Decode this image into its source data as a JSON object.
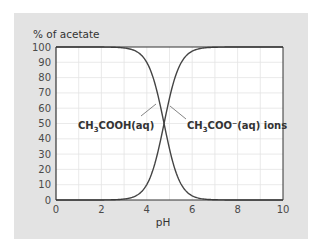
{
  "chart_data": {
    "type": "line",
    "title": "",
    "ylabel": "% of acetate",
    "xlabel": "pH",
    "xlim": [
      0,
      10
    ],
    "ylim": [
      0,
      100
    ],
    "x_ticks": [
      0,
      2,
      4,
      6,
      8,
      10
    ],
    "y_ticks": [
      0,
      10,
      20,
      30,
      40,
      50,
      60,
      70,
      80,
      90,
      100
    ],
    "grid": true,
    "legend": "inline annotations",
    "x": [
      0,
      1,
      2,
      2.5,
      3,
      3.5,
      4,
      4.25,
      4.5,
      4.76,
      5,
      5.25,
      5.5,
      6,
      6.5,
      7,
      8,
      9,
      10
    ],
    "series": [
      {
        "name": "CH3COOH(aq)",
        "label_main": "CH",
        "label_sub": "3",
        "label_rest": "COOH(aq)",
        "values": [
          100,
          100,
          99.4,
          98.2,
          94.6,
          84.8,
          85.2,
          76.4,
          64.5,
          50,
          36.5,
          24.4,
          15.4,
          5.4,
          1.8,
          0.6,
          0.1,
          0,
          0
        ]
      },
      {
        "name": "CH3COO−(aq) ions",
        "label_main": "CH",
        "label_sub": "3",
        "label_rest": "COO⁻(aq) ions",
        "values": [
          0,
          0,
          0.6,
          1.8,
          5.4,
          15.2,
          14.8,
          23.6,
          35.5,
          50,
          63.5,
          75.6,
          84.6,
          94.6,
          98.2,
          99.4,
          99.9,
          100,
          100
        ]
      }
    ],
    "pKa": 4.76
  }
}
